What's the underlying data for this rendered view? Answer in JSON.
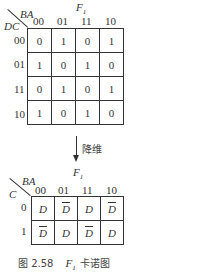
{
  "top_map": {
    "title": "F",
    "title_sub": "1",
    "row_var": "DC",
    "col_var": "BA",
    "col_headers": [
      "00",
      "01",
      "11",
      "10"
    ],
    "row_headers": [
      "00",
      "01",
      "11",
      "10"
    ],
    "cells": [
      [
        "0",
        "1",
        "0",
        "1"
      ],
      [
        "1",
        "0",
        "1",
        "0"
      ],
      [
        "0",
        "1",
        "0",
        "1"
      ],
      [
        "1",
        "0",
        "1",
        "0"
      ]
    ]
  },
  "arrow": {
    "label": "降维"
  },
  "bottom_map": {
    "title": "F",
    "title_sub": "1",
    "row_var": "C",
    "col_var": "BA",
    "col_headers": [
      "00",
      "01",
      "11",
      "10"
    ],
    "row_headers": [
      "0",
      "1"
    ],
    "cells": [
      [
        {
          "text": "D",
          "complement": false
        },
        {
          "text": "D",
          "complement": true
        },
        {
          "text": "D",
          "complement": false
        },
        {
          "text": "D",
          "complement": true
        }
      ],
      [
        {
          "text": "D",
          "complement": true
        },
        {
          "text": "D",
          "complement": false
        },
        {
          "text": "D",
          "complement": true
        },
        {
          "text": "D",
          "complement": false
        }
      ]
    ]
  },
  "caption": {
    "fig_no": "图 2.58",
    "var": "F",
    "var_sub": "1",
    "text": "卡诺图"
  }
}
